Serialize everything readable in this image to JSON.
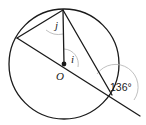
{
  "diagram": {
    "type": "circle-geometry",
    "circle": {
      "center": [
        64,
        64
      ],
      "radius": 55
    },
    "points": {
      "O": {
        "label": "O",
        "x": 64,
        "y": 64
      },
      "top": {
        "x": 63,
        "y": 10
      },
      "left": {
        "x": 17,
        "y": 38
      },
      "bottom_right": {
        "x": 112,
        "y": 95
      },
      "line_end": {
        "x": 140,
        "y": 116
      }
    },
    "angles": {
      "j": {
        "label": "j"
      },
      "i": {
        "label": "i"
      },
      "given": {
        "label": "136°",
        "value": 136
      }
    },
    "colors": {
      "stroke": "#1a1a1a",
      "angle_arc": "#b0b0b0"
    }
  }
}
